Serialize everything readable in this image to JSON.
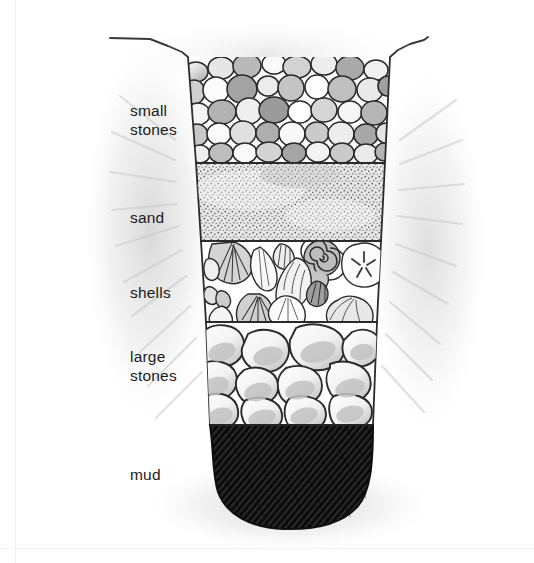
{
  "figure": {
    "medium": "pencil-drawing",
    "background_color": "#ffffff",
    "ink_color": "#1a1a1a"
  },
  "labels": [
    {
      "id": "small-stones",
      "text": "small\nstones",
      "layer_index": 0
    },
    {
      "id": "sand",
      "text": "sand",
      "layer_index": 1
    },
    {
      "id": "shells",
      "text": "shells",
      "layer_index": 2
    },
    {
      "id": "large-stones",
      "text": "large\nstones",
      "layer_index": 3
    },
    {
      "id": "mud",
      "text": "mud",
      "layer_index": 4
    }
  ],
  "layers": [
    {
      "name": "small stones",
      "texture": "packed-pebbles",
      "fill_colors": [
        "#ffffff",
        "#e8e8e8",
        "#cfcfcf",
        "#b4b4b4",
        "#9a9a9a"
      ],
      "outline_color": "#2b2b2b",
      "top_y": 57,
      "bottom_y": 163
    },
    {
      "name": "sand",
      "texture": "stipple-dots",
      "fill_colors": [
        "#e3e3e3"
      ],
      "dot_color": "#5a5a5a",
      "outline_color": "#2b2b2b",
      "top_y": 163,
      "bottom_y": 241
    },
    {
      "name": "shells",
      "texture": "assorted-shells",
      "fill_colors": [
        "#ffffff",
        "#d8d8d8",
        "#b0b0b0"
      ],
      "outline_color": "#2b2b2b",
      "top_y": 241,
      "bottom_y": 322,
      "shell_types": [
        "scallop",
        "spiral-snail",
        "sand-dollar",
        "cone",
        "clam",
        "mussel"
      ]
    },
    {
      "name": "large stones",
      "texture": "boulders",
      "fill_colors": [
        "#ffffff",
        "#dddddd",
        "#bdbdbd"
      ],
      "outline_color": "#2b2b2b",
      "top_y": 322,
      "bottom_y": 425
    },
    {
      "name": "mud",
      "texture": "dense-diagonal-hatch",
      "fill_colors": [
        "#1f1f1f"
      ],
      "hatch_color": "#000000",
      "outline_color": "#101010",
      "top_y": 425,
      "bottom_y": 527
    }
  ],
  "ground_line": {
    "name": "ground surface line",
    "color": "#3a3a3a",
    "left_start_x": 110,
    "right_end_x": 425,
    "pit_left_x": 188,
    "pit_right_x": 390
  },
  "pit": {
    "name": "dug pit outline",
    "top_left_x": 188,
    "top_right_x": 390,
    "bottom_left_x": 212,
    "bottom_right_x": 372,
    "top_y": 57,
    "bottom_y": 527
  }
}
